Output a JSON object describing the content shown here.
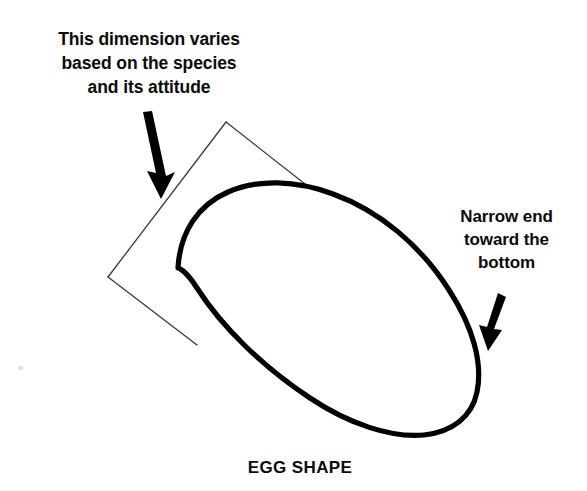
{
  "figure": {
    "caption": "EGG SHAPE",
    "background_color": "#ffffff",
    "ink_color": "#000000",
    "thin_line_color": "#3a3a3a",
    "width": 587,
    "height": 491
  },
  "annotations": {
    "left": {
      "text": "This dimension varies\nbased on the species\nand its attitude",
      "lines": [
        "This dimension varies",
        "based on the species",
        "and its attitude"
      ],
      "points_to": "dimension-bracket"
    },
    "right": {
      "text": "Narrow end\ntoward the\nbottom",
      "lines": [
        "Narrow end",
        "toward the",
        "bottom"
      ],
      "points_to": "egg-narrow-end"
    }
  },
  "shapes": {
    "egg": {
      "name": "egg-outline",
      "description": "tilted ovoid, broad rounded end upper-left, narrow end lower-right",
      "stroke_width": 5,
      "tilt_degrees": 35
    },
    "dimension_bracket": {
      "name": "dimension-bracket",
      "description": "thin bracket measuring the egg width across its short axis",
      "stroke_width": 1.2
    },
    "arrows": [
      {
        "name": "left-arrow",
        "direction": "down"
      },
      {
        "name": "right-arrow",
        "direction": "down"
      }
    ]
  }
}
